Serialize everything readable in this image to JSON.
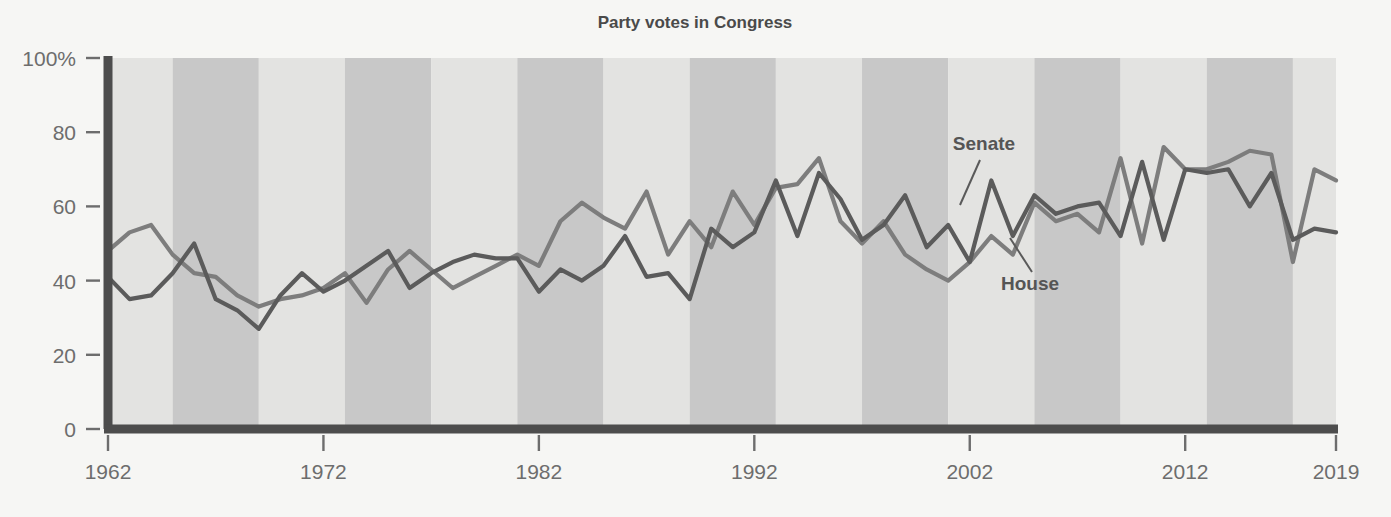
{
  "chart_data": {
    "type": "line",
    "title": "Party votes in Congress",
    "xlabel": "",
    "ylabel": "",
    "xlim": [
      1962,
      2019
    ],
    "ylim": [
      0,
      100
    ],
    "grid": false,
    "legend_position": "inline-annotation",
    "x_tick_labels": [
      "1962",
      "1972",
      "1982",
      "1992",
      "2002",
      "2012",
      "2019"
    ],
    "x_ticks": [
      1962,
      1972,
      1982,
      1992,
      2002,
      2012,
      2019
    ],
    "y_tick_labels": [
      "0",
      "20",
      "40",
      "60",
      "80",
      "100%"
    ],
    "y_ticks": [
      0,
      20,
      40,
      60,
      80,
      100
    ],
    "x": [
      1962,
      1963,
      1964,
      1965,
      1966,
      1967,
      1968,
      1969,
      1970,
      1971,
      1972,
      1973,
      1974,
      1975,
      1976,
      1977,
      1978,
      1979,
      1980,
      1981,
      1982,
      1983,
      1984,
      1985,
      1986,
      1987,
      1988,
      1989,
      1990,
      1991,
      1992,
      1993,
      1994,
      1995,
      1996,
      1997,
      1998,
      1999,
      2000,
      2001,
      2002,
      2003,
      2004,
      2005,
      2006,
      2007,
      2008,
      2009,
      2010,
      2011,
      2012,
      2013,
      2014,
      2015,
      2016,
      2017,
      2018,
      2019
    ],
    "series": [
      {
        "name": "House",
        "color": "#7d7d7d",
        "values": [
          48,
          53,
          55,
          47,
          42,
          41,
          36,
          33,
          35,
          36,
          38,
          42,
          34,
          43,
          48,
          43,
          38,
          41,
          44,
          47,
          44,
          56,
          61,
          57,
          54,
          64,
          47,
          56,
          49,
          64,
          55,
          65,
          66,
          73,
          56,
          50,
          56,
          47,
          43,
          40,
          45,
          52,
          47,
          61,
          56,
          58,
          53,
          73,
          50,
          76,
          70,
          70,
          72,
          75,
          74,
          45,
          70,
          67
        ]
      },
      {
        "name": "Senate",
        "color": "#5b5b5b",
        "values": [
          41,
          35,
          36,
          42,
          50,
          35,
          32,
          27,
          36,
          42,
          37,
          40,
          44,
          48,
          38,
          42,
          45,
          47,
          46,
          46,
          37,
          43,
          40,
          44,
          52,
          41,
          42,
          35,
          54,
          49,
          53,
          67,
          52,
          69,
          62,
          51,
          55,
          63,
          49,
          55,
          45,
          67,
          52,
          63,
          58,
          60,
          61,
          52,
          72,
          51,
          70,
          69,
          70,
          60,
          69,
          51,
          54,
          53
        ]
      }
    ],
    "annotations": [
      {
        "label": "Senate",
        "x": 984,
        "y": 150
      },
      {
        "label": "House",
        "x": 1030,
        "y": 290
      }
    ],
    "background_bands": {
      "description": "alternating shaded vertical bands every 4 years (presidential terms)",
      "light_color": "#e3e3e1",
      "dark_color": "#c8c8c8",
      "start_year": 1961,
      "band_years": 4
    },
    "axis_color": "#4d4d4d",
    "plot_background": "#e3e3e1",
    "page_background": "#f6f6f4"
  }
}
